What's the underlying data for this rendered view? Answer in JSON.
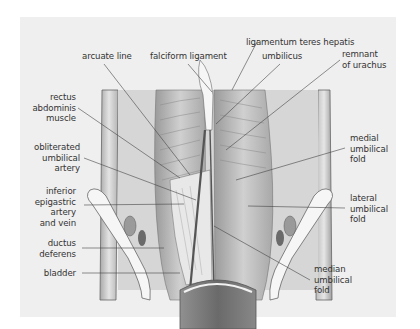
{
  "figure": {
    "type": "anatomical illustration",
    "colors": {
      "panel": "#efefef",
      "text": "#333333",
      "leader": "#444444",
      "tissue_light": "#d8d8d8",
      "tissue_dark": "#8a8a8a"
    }
  },
  "labels": {
    "ligamentum_teres": "ligamentum teres hepatis",
    "arcuate_line": "arcuate line",
    "falciform": "falciform ligament",
    "umbilicus": "umbilicus",
    "urachus_1": "remnant",
    "urachus_2": "of urachus",
    "rectus_1": "rectus",
    "rectus_2": "abdominis",
    "rectus_3": "muscle",
    "oblit_1": "obliterated",
    "oblit_2": "umbilical",
    "oblit_3": "artery",
    "epig_1": "inferior",
    "epig_2": "epigastric",
    "epig_3": "artery",
    "epig_4": "and vein",
    "ductus_1": "ductus",
    "ductus_2": "deferens",
    "bladder": "bladder",
    "medial_1": "medial",
    "medial_2": "umbilical",
    "medial_3": "fold",
    "lateral_1": "lateral",
    "lateral_2": "umbilical",
    "lateral_3": "fold",
    "median_1": "median",
    "median_2": "umbilical",
    "median_3": "fold"
  }
}
